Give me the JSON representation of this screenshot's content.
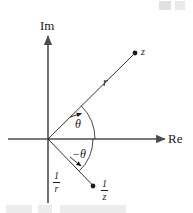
{
  "figure": {
    "title_alt": "Complex plane diagram showing z and its reciprocal 1/z",
    "background_color": "#ffffff",
    "ink_color": "#1a1a1a",
    "axis_color": "#4d4d4d",
    "axes": {
      "imaginary_label": "Im",
      "real_label": "Re"
    },
    "labels": {
      "point_z": "z",
      "radius_r": "r",
      "angle_positive": "θ",
      "angle_negative": "−θ",
      "reciprocal_radius_numerator": "1",
      "reciprocal_radius_denominator": "r",
      "reciprocal_point_numerator": "1",
      "reciprocal_point_denominator": "z"
    },
    "points": [
      {
        "name": "z",
        "x": 135,
        "y": 53
      },
      {
        "name": "1/z",
        "x": 93,
        "y": 186
      }
    ],
    "origin": {
      "x": 48,
      "y": 139
    }
  }
}
